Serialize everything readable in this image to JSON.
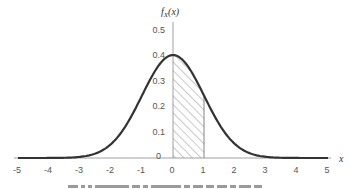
{
  "chart_data": {
    "type": "line",
    "title": "",
    "ylabel": "f_X(x)",
    "xlabel": "x",
    "function": "standard normal pdf",
    "x": [
      -5,
      -4,
      -3,
      -2,
      -1,
      0,
      1,
      2,
      3,
      4,
      5
    ],
    "series": [
      {
        "name": "f_X(x)",
        "values": [
          1.5e-06,
          0.000134,
          0.0044,
          0.054,
          0.242,
          0.399,
          0.242,
          0.054,
          0.0044,
          0.000134,
          1.5e-06
        ]
      }
    ],
    "shaded_region": {
      "from": 0,
      "to": 1,
      "pattern": "diagonal-hatch"
    },
    "xticks": [
      "-5",
      "-4",
      "-3",
      "-2",
      "-1",
      "0",
      "1",
      "2",
      "3",
      "4",
      "5"
    ],
    "yticks": [
      "0",
      "0.1",
      "0.2",
      "0.3",
      "0.4",
      "0.5"
    ],
    "xlim": [
      -5,
      5
    ],
    "ylim": [
      0,
      0.5
    ],
    "grid": false,
    "legend": null
  },
  "labels": {
    "y_axis_title_main": "f",
    "y_axis_title_sub": "X",
    "y_axis_title_arg": "(x)",
    "x_axis_title": "x"
  },
  "colors": {
    "curve": "#333333",
    "axis": "#888888",
    "hatch": "#777777"
  }
}
